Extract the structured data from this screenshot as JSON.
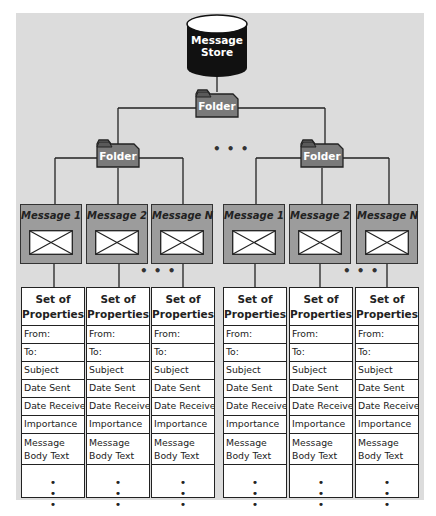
{
  "diagram": {
    "root": {
      "label_line1": "Message",
      "label_line2": "Store",
      "icon": "database-cylinder-icon"
    },
    "top_folder": {
      "label": "Folder",
      "icon": "folder-icon"
    },
    "folder_ellipsis": "• • •",
    "subfolders": [
      {
        "label": "Folder",
        "messages": [
          {
            "label": "Message 1",
            "icon": "envelope-icon"
          },
          {
            "label": "Message 2",
            "icon": "envelope-icon"
          },
          {
            "label": "Message N",
            "icon": "envelope-icon"
          }
        ],
        "message_ellipsis": "• • •"
      },
      {
        "label": "Folder",
        "messages": [
          {
            "label": "Message 1",
            "icon": "envelope-icon"
          },
          {
            "label": "Message 2",
            "icon": "envelope-icon"
          },
          {
            "label": "Message N",
            "icon": "envelope-icon"
          }
        ],
        "message_ellipsis": "• • •"
      }
    ],
    "property_set": {
      "header_line1": "Set of",
      "header_line2": "Properties",
      "rows": [
        "From:",
        "To:",
        "Subject",
        "Date Sent",
        "Date Received",
        "Importance"
      ],
      "body_line1": "Message",
      "body_line2": "Body Text",
      "continuation": [
        "•",
        "•",
        "•"
      ]
    },
    "colors": {
      "background": "#dcdcdc",
      "store_fill": "#111111",
      "folder_fill": "#7a7a7a",
      "message_fill": "#9c9c9c",
      "line": "#222222"
    }
  }
}
